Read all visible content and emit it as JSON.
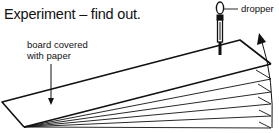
{
  "title": "Experiment – find out.",
  "labels": {
    "board": "board covered with paper",
    "dropper": "dropper"
  },
  "diagram": {
    "icons": [
      "dropper-icon",
      "board-icon",
      "arrow-up-icon",
      "arrow-down-icon"
    ],
    "line_color": "#111111",
    "background": "#ffffff"
  }
}
